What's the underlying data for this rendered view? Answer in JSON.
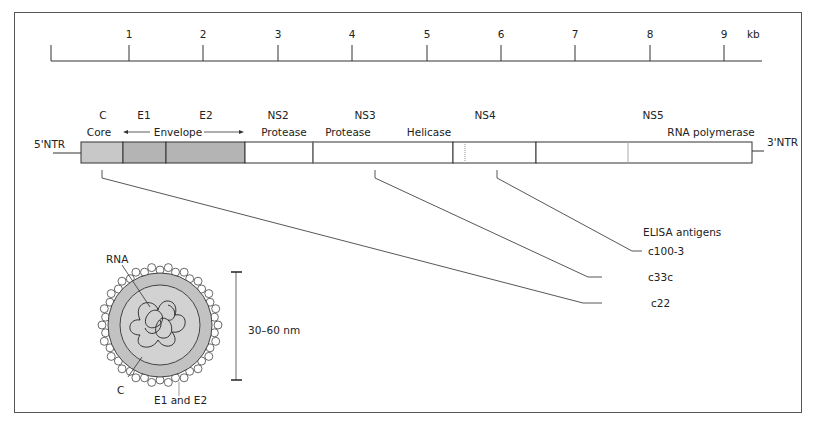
{
  "scale": {
    "unit": "kb",
    "ticks": [
      "1",
      "2",
      "3",
      "4",
      "5",
      "6",
      "7",
      "8",
      "9"
    ]
  },
  "genome": {
    "five_prime": "5'NTR",
    "three_prime": "3'NTR",
    "regions": [
      {
        "name": "C",
        "function": "Core"
      },
      {
        "name": "E1",
        "function": ""
      },
      {
        "name": "E2",
        "function": ""
      },
      {
        "name": "NS2",
        "function": "Protease"
      },
      {
        "name": "NS3",
        "function": "Protease"
      },
      {
        "name": "NS3-helicase",
        "function": "Helicase"
      },
      {
        "name": "NS4",
        "function": ""
      },
      {
        "name": "NS5",
        "function": "RNA polymerase"
      }
    ],
    "envelope_label": "Envelope",
    "colors": {
      "core": "#c8c8c8",
      "envelope": "#b4b4b4",
      "nonstructural": "#ffffff",
      "outline": "#333333"
    }
  },
  "elisa": {
    "title": "ELISA antigens",
    "antigens": [
      "c100-3",
      "c33c",
      "c22"
    ]
  },
  "virion": {
    "rna_label": "RNA",
    "core_label": "C",
    "envelope_label": "E1 and E2",
    "size_label": "30–60 nm"
  }
}
